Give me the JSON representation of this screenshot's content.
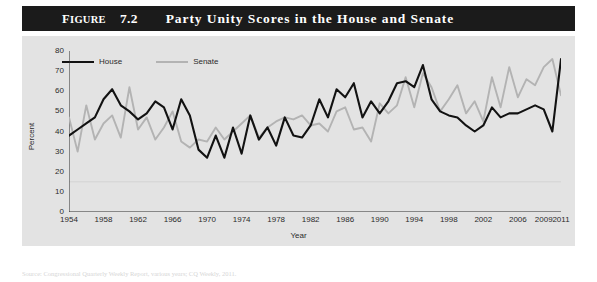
{
  "figure": {
    "label_prefix": "Figure",
    "number": "7.2",
    "title": "Party Unity Scores in the House and Senate",
    "source_note": "Source: Congressional Quarterly Weekly Report, various years; CQ Weekly, 2011."
  },
  "legend": {
    "position": "top-left",
    "items": [
      {
        "label": "House",
        "color": "#121212",
        "swatch": "line-swatch-dark"
      },
      {
        "label": "Senate",
        "color": "#b3b3b3",
        "swatch": "line-swatch-gray"
      }
    ]
  },
  "colors": {
    "panel_background": "#e3e3e3",
    "title_background": "#1b1b1b",
    "title_text": "#ffffff",
    "house_line": "#121212",
    "senate_line": "#b3b3b3",
    "axis": "#2b2b2b",
    "gridline": "#cfcfcf"
  },
  "chart_data": {
    "type": "line",
    "title": "Party Unity Scores in the House and Senate",
    "xlabel": "Year",
    "ylabel": "Percent",
    "xlim": [
      1954,
      2011
    ],
    "ylim": [
      0,
      80
    ],
    "yticks": [
      0,
      10,
      20,
      30,
      40,
      50,
      60,
      70,
      80
    ],
    "xticks": [
      1954,
      1958,
      1962,
      1966,
      1970,
      1974,
      1978,
      1982,
      1986,
      1990,
      1994,
      1998,
      2002,
      2006,
      2009,
      2011
    ],
    "grid": "faint horizontal line near 15",
    "legend_position": "top-left",
    "x": [
      1954,
      1955,
      1956,
      1957,
      1958,
      1959,
      1960,
      1961,
      1962,
      1963,
      1964,
      1965,
      1966,
      1967,
      1968,
      1969,
      1970,
      1971,
      1972,
      1973,
      1974,
      1975,
      1976,
      1977,
      1978,
      1979,
      1980,
      1981,
      1982,
      1983,
      1984,
      1985,
      1986,
      1987,
      1988,
      1989,
      1990,
      1991,
      1992,
      1993,
      1994,
      1995,
      1996,
      1997,
      1998,
      1999,
      2000,
      2001,
      2002,
      2003,
      2004,
      2005,
      2006,
      2007,
      2008,
      2009,
      2010,
      2011
    ],
    "series": [
      {
        "name": "House",
        "color": "#121212",
        "values": [
          38,
          41,
          44,
          47,
          56,
          61,
          53,
          50,
          46,
          49,
          55,
          52,
          41,
          56,
          48,
          31,
          27,
          38,
          27,
          42,
          29,
          48,
          36,
          42,
          33,
          47,
          38,
          37,
          43,
          56,
          47,
          61,
          57,
          64,
          47,
          55,
          49,
          55,
          64,
          65,
          62,
          73,
          56,
          50,
          48,
          47,
          43,
          40,
          43,
          52,
          47,
          49,
          49,
          51,
          53,
          51,
          40,
          76
        ]
      },
      {
        "name": "Senate",
        "color": "#b3b3b3",
        "values": [
          47,
          30,
          53,
          36,
          44,
          48,
          37,
          62,
          41,
          47,
          36,
          42,
          50,
          35,
          32,
          36,
          35,
          42,
          36,
          40,
          44,
          48,
          37,
          42,
          45,
          47,
          46,
          48,
          43,
          44,
          40,
          50,
          52,
          41,
          42,
          35,
          54,
          49,
          53,
          67,
          52,
          69,
          62,
          50,
          56,
          63,
          49,
          55,
          45,
          67,
          52,
          72,
          57,
          66,
          63,
          72,
          76,
          58
        ]
      }
    ]
  }
}
